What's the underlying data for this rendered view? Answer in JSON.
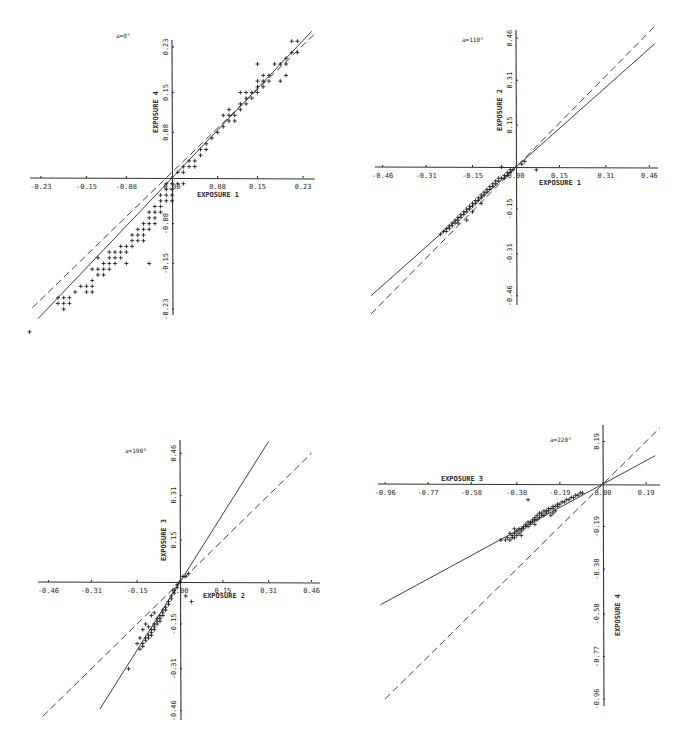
{
  "chart_data": [
    {
      "type": "scatter",
      "title": "a=0°",
      "xlabel": "EXPOSURE 1",
      "ylabel": "EXPOSURE 4",
      "xticks": [
        "-0.23",
        "-0.15",
        "-0.08",
        "0.00",
        "0.08",
        "0.15",
        "0.23"
      ],
      "yticks": [
        "0.23",
        "0.15",
        "0.08",
        "-0.08",
        "-0.15",
        "-0.23"
      ],
      "xlim": [
        -0.23,
        0.23
      ],
      "ylim": [
        -0.23,
        0.23
      ],
      "grid": false,
      "frame": {
        "ox": 172,
        "oy": 178,
        "sx": 570,
        "sy": 570,
        "xaxis": [
          30,
          315
        ],
        "yaxis": [
          40,
          315
        ]
      },
      "lines": [
        {
          "style": "solid",
          "slope": 1.05,
          "x": [
            -0.235,
            0.245
          ]
        },
        {
          "style": "dashed",
          "slope": 0.97,
          "x": [
            -0.245,
            0.25
          ],
          "offset": 0.01
        }
      ],
      "points": [
        [
          -0.25,
          -0.27
        ],
        [
          -0.2,
          -0.22
        ],
        [
          -0.19,
          -0.21
        ],
        [
          -0.2,
          -0.21
        ],
        [
          -0.19,
          -0.22
        ],
        [
          -0.18,
          -0.21
        ],
        [
          -0.18,
          -0.22
        ],
        [
          -0.19,
          -0.23
        ],
        [
          -0.16,
          -0.19
        ],
        [
          -0.17,
          -0.2
        ],
        [
          -0.15,
          -0.2
        ],
        [
          -0.15,
          -0.19
        ],
        [
          -0.14,
          -0.19
        ],
        [
          -0.14,
          -0.2
        ],
        [
          -0.14,
          -0.16
        ],
        [
          -0.13,
          -0.16
        ],
        [
          -0.13,
          -0.17
        ],
        [
          -0.12,
          -0.16
        ],
        [
          -0.12,
          -0.15
        ],
        [
          -0.11,
          -0.16
        ],
        [
          -0.11,
          -0.15
        ],
        [
          -0.11,
          -0.14
        ],
        [
          -0.1,
          -0.14
        ],
        [
          -0.1,
          -0.15
        ],
        [
          -0.1,
          -0.13
        ],
        [
          -0.09,
          -0.14
        ],
        [
          -0.09,
          -0.13
        ],
        [
          -0.09,
          -0.12
        ],
        [
          -0.08,
          -0.13
        ],
        [
          -0.08,
          -0.12
        ],
        [
          -0.08,
          -0.15
        ],
        [
          -0.07,
          -0.11
        ],
        [
          -0.07,
          -0.12
        ],
        [
          -0.07,
          -0.1
        ],
        [
          -0.06,
          -0.11
        ],
        [
          -0.06,
          -0.1
        ],
        [
          -0.06,
          -0.09
        ],
        [
          -0.05,
          -0.1
        ],
        [
          -0.05,
          -0.09
        ],
        [
          -0.05,
          -0.11
        ],
        [
          -0.05,
          -0.08
        ],
        [
          -0.04,
          -0.09
        ],
        [
          -0.04,
          -0.08
        ],
        [
          -0.04,
          -0.07
        ],
        [
          -0.04,
          -0.06
        ],
        [
          -0.03,
          -0.08
        ],
        [
          -0.03,
          -0.07
        ],
        [
          -0.03,
          -0.06
        ],
        [
          -0.03,
          -0.05
        ],
        [
          -0.02,
          -0.06
        ],
        [
          -0.02,
          -0.05
        ],
        [
          -0.02,
          -0.04
        ],
        [
          -0.02,
          -0.03
        ],
        [
          -0.01,
          -0.04
        ],
        [
          -0.01,
          -0.03
        ],
        [
          -0.01,
          -0.02
        ],
        [
          -0.01,
          -0.01
        ],
        [
          0.0,
          -0.02
        ],
        [
          0.0,
          -0.01
        ],
        [
          0.0,
          -0.03
        ],
        [
          0.0,
          -0.04
        ],
        [
          -0.04,
          -0.15
        ],
        [
          -0.11,
          -0.13
        ],
        [
          -0.12,
          -0.17
        ],
        [
          -0.14,
          -0.18
        ],
        [
          -0.13,
          -0.14
        ],
        [
          0.01,
          0.01
        ],
        [
          0.02,
          0.01
        ],
        [
          0.02,
          0.02
        ],
        [
          0.01,
          -0.01
        ],
        [
          0.02,
          -0.01
        ],
        [
          0.03,
          0.02
        ],
        [
          0.03,
          0.03
        ],
        [
          0.04,
          0.02
        ],
        [
          0.04,
          0.03
        ],
        [
          0.05,
          0.04
        ],
        [
          0.05,
          0.05
        ],
        [
          0.06,
          0.05
        ],
        [
          0.06,
          0.06
        ],
        [
          0.07,
          0.07
        ],
        [
          0.08,
          0.08
        ],
        [
          0.09,
          0.09
        ],
        [
          0.1,
          0.1
        ],
        [
          0.1,
          0.11
        ],
        [
          0.1,
          0.12
        ],
        [
          0.11,
          0.1
        ],
        [
          0.11,
          0.11
        ],
        [
          0.12,
          0.12
        ],
        [
          0.12,
          0.13
        ],
        [
          0.13,
          0.14
        ],
        [
          0.13,
          0.15
        ],
        [
          0.12,
          0.15
        ],
        [
          0.14,
          0.14
        ],
        [
          0.15,
          0.15
        ],
        [
          0.15,
          0.16
        ],
        [
          0.16,
          0.16
        ],
        [
          0.16,
          0.17
        ],
        [
          0.15,
          0.17
        ],
        [
          0.16,
          0.18
        ],
        [
          0.17,
          0.17
        ],
        [
          0.17,
          0.18
        ],
        [
          0.19,
          0.2
        ],
        [
          0.2,
          0.21
        ],
        [
          0.21,
          0.22
        ],
        [
          0.21,
          0.24
        ],
        [
          0.22,
          0.24
        ],
        [
          0.2,
          0.2
        ],
        [
          0.22,
          0.22
        ],
        [
          0.19,
          0.17
        ],
        [
          0.2,
          0.18
        ],
        [
          0.18,
          0.2
        ],
        [
          0.15,
          0.2
        ],
        [
          0.14,
          0.15
        ],
        [
          0.13,
          0.13
        ],
        [
          0.09,
          0.11
        ]
      ]
    },
    {
      "type": "scatter",
      "title": "a=110°",
      "xlabel": "EXPOSURE 1",
      "ylabel": "EXPOSURE 2",
      "xticks": [
        "-0.46",
        "-0.31",
        "-0.15",
        "0.00",
        "0.15",
        "0.31",
        "0.46"
      ],
      "yticks": [
        "0.46",
        "0.31",
        "0.15",
        "-0.15",
        "-0.31",
        "-0.46"
      ],
      "xlim": [
        -0.46,
        0.46
      ],
      "ylim": [
        -0.46,
        0.46
      ],
      "grid": false,
      "frame": {
        "ox": 516,
        "oy": 167,
        "sx": 290,
        "sy": 280,
        "xaxis": [
          375,
          658
        ],
        "yaxis": [
          30,
          305
        ]
      },
      "lines": [
        {
          "style": "solid",
          "slope": 0.92,
          "x": [
            -0.5,
            0.48
          ]
        },
        {
          "style": "dashed",
          "slope": 1.05,
          "x": [
            -0.5,
            0.48
          ]
        }
      ],
      "points": [
        [
          -0.25,
          -0.23
        ],
        [
          -0.24,
          -0.22
        ],
        [
          -0.24,
          -0.23
        ],
        [
          -0.23,
          -0.21
        ],
        [
          -0.23,
          -0.22
        ],
        [
          -0.22,
          -0.2
        ],
        [
          -0.22,
          -0.21
        ],
        [
          -0.21,
          -0.19
        ],
        [
          -0.21,
          -0.2
        ],
        [
          -0.2,
          -0.19
        ],
        [
          -0.2,
          -0.18
        ],
        [
          -0.19,
          -0.18
        ],
        [
          -0.19,
          -0.17
        ],
        [
          -0.18,
          -0.17
        ],
        [
          -0.18,
          -0.16
        ],
        [
          -0.17,
          -0.16
        ],
        [
          -0.17,
          -0.15
        ],
        [
          -0.16,
          -0.15
        ],
        [
          -0.16,
          -0.14
        ],
        [
          -0.15,
          -0.14
        ],
        [
          -0.15,
          -0.13
        ],
        [
          -0.14,
          -0.13
        ],
        [
          -0.14,
          -0.12
        ],
        [
          -0.13,
          -0.12
        ],
        [
          -0.13,
          -0.11
        ],
        [
          -0.12,
          -0.11
        ],
        [
          -0.12,
          -0.1
        ],
        [
          -0.11,
          -0.1
        ],
        [
          -0.11,
          -0.09
        ],
        [
          -0.1,
          -0.09
        ],
        [
          -0.1,
          -0.08
        ],
        [
          -0.09,
          -0.08
        ],
        [
          -0.09,
          -0.07
        ],
        [
          -0.08,
          -0.07
        ],
        [
          -0.08,
          -0.06
        ],
        [
          -0.07,
          -0.06
        ],
        [
          -0.07,
          -0.05
        ],
        [
          -0.06,
          -0.05
        ],
        [
          -0.06,
          -0.04
        ],
        [
          -0.05,
          -0.04
        ],
        [
          -0.04,
          -0.04
        ],
        [
          -0.04,
          -0.03
        ],
        [
          -0.03,
          -0.03
        ],
        [
          -0.03,
          -0.02
        ],
        [
          -0.02,
          -0.02
        ],
        [
          -0.02,
          -0.01
        ],
        [
          -0.01,
          -0.01
        ],
        [
          -0.2,
          -0.2
        ],
        [
          -0.17,
          -0.19
        ],
        [
          -0.26,
          -0.24
        ],
        [
          -0.05,
          0.0
        ],
        [
          0.02,
          0.01
        ],
        [
          0.03,
          0.02
        ],
        [
          0.07,
          -0.01
        ],
        [
          -0.15,
          -0.16
        ],
        [
          -0.12,
          -0.13
        ]
      ]
    },
    {
      "type": "scatter",
      "title": "a=190°",
      "xlabel": "EXPOSURE 2",
      "ylabel": "EXPOSURE 3",
      "xticks": [
        "-0.46",
        "-0.31",
        "-0.15",
        "0.00",
        "0.15",
        "0.31",
        "0.46"
      ],
      "yticks": [
        "0.46",
        "0.31",
        "0.15",
        "-0.15",
        "-0.31",
        "-0.46"
      ],
      "xlim": [
        -0.46,
        0.46
      ],
      "ylim": [
        -0.46,
        0.46
      ],
      "grid": false,
      "frame": {
        "ox": 180,
        "oy": 582,
        "sx": 286,
        "sy": 280,
        "xaxis": [
          38,
          320
        ],
        "yaxis": [
          440,
          720
        ]
      },
      "lines": [
        {
          "style": "solid",
          "slope": 1.62,
          "x": [
            -0.28,
            0.31
          ]
        },
        {
          "style": "dashed",
          "slope": 1.0,
          "x": [
            -0.48,
            0.46
          ]
        }
      ],
      "points": [
        [
          -0.14,
          -0.24
        ],
        [
          -0.13,
          -0.23
        ],
        [
          -0.13,
          -0.22
        ],
        [
          -0.12,
          -0.21
        ],
        [
          -0.12,
          -0.2
        ],
        [
          -0.11,
          -0.2
        ],
        [
          -0.11,
          -0.19
        ],
        [
          -0.1,
          -0.19
        ],
        [
          -0.1,
          -0.18
        ],
        [
          -0.1,
          -0.17
        ],
        [
          -0.09,
          -0.17
        ],
        [
          -0.09,
          -0.16
        ],
        [
          -0.09,
          -0.15
        ],
        [
          -0.08,
          -0.15
        ],
        [
          -0.08,
          -0.14
        ],
        [
          -0.08,
          -0.13
        ],
        [
          -0.07,
          -0.14
        ],
        [
          -0.07,
          -0.13
        ],
        [
          -0.07,
          -0.12
        ],
        [
          -0.06,
          -0.12
        ],
        [
          -0.06,
          -0.11
        ],
        [
          -0.06,
          -0.1
        ],
        [
          -0.05,
          -0.1
        ],
        [
          -0.05,
          -0.09
        ],
        [
          -0.04,
          -0.08
        ],
        [
          -0.04,
          -0.07
        ],
        [
          -0.03,
          -0.06
        ],
        [
          -0.03,
          -0.05
        ],
        [
          -0.02,
          -0.04
        ],
        [
          -0.02,
          -0.03
        ],
        [
          -0.01,
          -0.02
        ],
        [
          -0.01,
          -0.01
        ],
        [
          0.0,
          0.0
        ],
        [
          0.01,
          0.02
        ],
        [
          0.02,
          0.02
        ],
        [
          0.03,
          0.03
        ],
        [
          0.02,
          -0.05
        ],
        [
          0.04,
          -0.07
        ],
        [
          -0.1,
          -0.12
        ],
        [
          -0.12,
          -0.15
        ],
        [
          -0.11,
          -0.16
        ],
        [
          -0.13,
          -0.17
        ],
        [
          -0.14,
          -0.2
        ],
        [
          -0.15,
          -0.22
        ],
        [
          -0.09,
          -0.11
        ],
        [
          -0.18,
          -0.31
        ]
      ]
    },
    {
      "type": "scatter",
      "title": "a=220°",
      "xlabel": "EXPOSURE 3",
      "ylabel": "EXPOSURE 4",
      "xticks": [
        "-0.96",
        "-0.77",
        "-0.58",
        "-0.38",
        "-0.19",
        "0.00",
        "0.19"
      ],
      "yticks": [
        "0.19",
        "-0.19",
        "-0.38",
        "-0.58",
        "-0.77",
        "-0.96"
      ],
      "xlim": [
        -0.96,
        0.19
      ],
      "ylim": [
        -0.96,
        0.19
      ],
      "grid": false,
      "frame": {
        "ox": 603,
        "oy": 484,
        "sx": 227,
        "sy": 224,
        "xaxis": [
          378,
          660
        ],
        "yaxis": [
          425,
          706
        ]
      },
      "lines": [
        {
          "style": "solid",
          "slope": 0.55,
          "x": [
            -0.98,
            0.23
          ]
        },
        {
          "style": "dashed",
          "slope": 1.0,
          "x": [
            -0.96,
            0.25
          ]
        }
      ],
      "points": [
        [
          -0.43,
          -0.25
        ],
        [
          -0.42,
          -0.24
        ],
        [
          -0.41,
          -0.25
        ],
        [
          -0.4,
          -0.24
        ],
        [
          -0.4,
          -0.23
        ],
        [
          -0.39,
          -0.24
        ],
        [
          -0.39,
          -0.22
        ],
        [
          -0.38,
          -0.23
        ],
        [
          -0.38,
          -0.21
        ],
        [
          -0.37,
          -0.22
        ],
        [
          -0.37,
          -0.2
        ],
        [
          -0.36,
          -0.21
        ],
        [
          -0.36,
          -0.2
        ],
        [
          -0.35,
          -0.2
        ],
        [
          -0.35,
          -0.19
        ],
        [
          -0.34,
          -0.19
        ],
        [
          -0.34,
          -0.18
        ],
        [
          -0.33,
          -0.19
        ],
        [
          -0.33,
          -0.17
        ],
        [
          -0.32,
          -0.18
        ],
        [
          -0.32,
          -0.17
        ],
        [
          -0.31,
          -0.17
        ],
        [
          -0.31,
          -0.16
        ],
        [
          -0.3,
          -0.16
        ],
        [
          -0.3,
          -0.15
        ],
        [
          -0.29,
          -0.16
        ],
        [
          -0.29,
          -0.14
        ],
        [
          -0.28,
          -0.15
        ],
        [
          -0.28,
          -0.13
        ],
        [
          -0.27,
          -0.14
        ],
        [
          -0.27,
          -0.13
        ],
        [
          -0.26,
          -0.12
        ],
        [
          -0.26,
          -0.14
        ],
        [
          -0.25,
          -0.13
        ],
        [
          -0.25,
          -0.12
        ],
        [
          -0.24,
          -0.12
        ],
        [
          -0.24,
          -0.11
        ],
        [
          -0.23,
          -0.11
        ],
        [
          -0.22,
          -0.11
        ],
        [
          -0.22,
          -0.1
        ],
        [
          -0.21,
          -0.1
        ],
        [
          -0.2,
          -0.1
        ],
        [
          -0.2,
          -0.09
        ],
        [
          -0.19,
          -0.09
        ],
        [
          -0.18,
          -0.08
        ],
        [
          -0.17,
          -0.08
        ],
        [
          -0.16,
          -0.07
        ],
        [
          -0.15,
          -0.07
        ],
        [
          -0.14,
          -0.06
        ],
        [
          -0.13,
          -0.06
        ],
        [
          -0.12,
          -0.05
        ],
        [
          -0.11,
          -0.05
        ],
        [
          -0.1,
          -0.04
        ],
        [
          -0.09,
          -0.04
        ],
        [
          -0.33,
          -0.07
        ],
        [
          -0.41,
          -0.22
        ],
        [
          -0.39,
          -0.2
        ],
        [
          -0.36,
          -0.23
        ],
        [
          -0.3,
          -0.18
        ],
        [
          -0.23,
          -0.14
        ],
        [
          -0.22,
          -0.13
        ],
        [
          -0.45,
          -0.25
        ],
        [
          -0.21,
          -0.12
        ]
      ]
    }
  ]
}
